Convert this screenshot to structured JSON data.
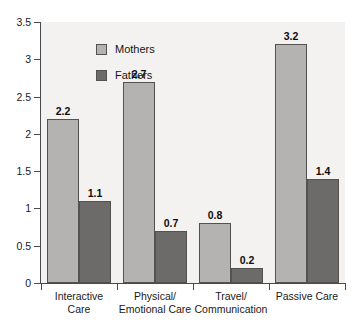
{
  "chart_data": {
    "type": "bar",
    "title": "",
    "subtitle": "",
    "xlabel": "",
    "ylabel": "",
    "ylim": [
      0,
      3.5
    ],
    "yticks": [
      "0",
      "0.5",
      "1",
      "1.5",
      "2",
      "2.5",
      "3",
      "3.5"
    ],
    "ytick_values": [
      0,
      0.5,
      1,
      1.5,
      2,
      2.5,
      3,
      3.5
    ],
    "grid": false,
    "legend_position": "top-left",
    "categories": [
      "Interactive Care",
      "Physical/ Emotional Care",
      "Travel/ Communication",
      "Passive Care"
    ],
    "category_lines": [
      [
        "Interactive",
        "Care"
      ],
      [
        "Physical/",
        "Emotional Care"
      ],
      [
        "Travel/",
        "Communication"
      ],
      [
        "Passive Care",
        ""
      ]
    ],
    "series": [
      {
        "name": "Mothers",
        "color": "#b4b3b1",
        "values": [
          2.2,
          2.7,
          0.8,
          3.2
        ],
        "labels": [
          "2.2",
          "2.7",
          "0.8",
          "3.2"
        ]
      },
      {
        "name": "Fathers",
        "color": "#6d6b69",
        "values": [
          1.1,
          0.7,
          0.2,
          1.4
        ],
        "labels": [
          "1.1",
          "0.7",
          "0.2",
          "1.4"
        ]
      }
    ]
  },
  "legend": {
    "items": [
      {
        "label": "Mothers",
        "color": "#b4b3b1"
      },
      {
        "label": "Fathers",
        "color": "#6d6b69"
      }
    ]
  },
  "style": {
    "plot_background": "#f4f2f0",
    "axis_color": "#4a4a4a",
    "bar_border": "#54514f",
    "text_color": "#1a1a1a"
  }
}
